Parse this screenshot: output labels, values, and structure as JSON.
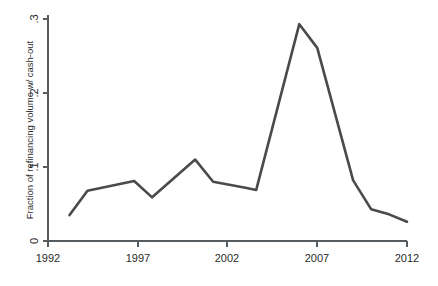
{
  "chart_data": {
    "type": "line",
    "title": "",
    "subtitle": "",
    "xlabel": "",
    "ylabel": "Fraction of refinancing volume w/ cash-out",
    "xlim": [
      1992,
      2012
    ],
    "ylim": [
      0,
      0.3
    ],
    "grid": false,
    "legend": null,
    "x_ticks": [
      1992,
      1997,
      2002,
      2007,
      2012
    ],
    "x_tick_labels": [
      "1992",
      "1997",
      "2002",
      "2007",
      "2012"
    ],
    "y_ticks": [
      0,
      0.1,
      0.2,
      0.3
    ],
    "y_tick_labels": [
      "0",
      ".1",
      ".2",
      ".3"
    ],
    "line_color": "#4a4a4a",
    "axis_color": "#555b5e",
    "series": [
      {
        "name": "Fraction of refinancing volume w/ cash-out",
        "x": [
          1993.2,
          1994.2,
          1996.8,
          1997.8,
          2000.2,
          2001.2,
          2003.0,
          2003.6,
          2006.0,
          2007.0,
          2009.0,
          2010.0,
          2011.0,
          2012.0
        ],
        "values": [
          0.035,
          0.068,
          0.081,
          0.059,
          0.11,
          0.08,
          0.072,
          0.069,
          0.293,
          0.261,
          0.082,
          0.043,
          0.036,
          0.026
        ]
      }
    ]
  },
  "axis": {
    "y_label": "Fraction of refinancing volume w/ cash-out"
  }
}
